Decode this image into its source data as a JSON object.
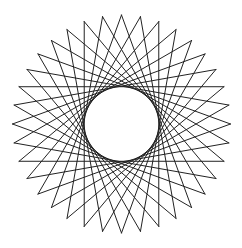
{
  "figure": {
    "type": "star-polygon",
    "points": 36,
    "step": 14,
    "center": [
      121.5,
      124
    ],
    "outer_radius": 109,
    "start_angle_deg": -90,
    "inner_envelope_radius": 37,
    "stroke_color": "#222222",
    "stroke_width": 1,
    "background": "#ffffff"
  }
}
